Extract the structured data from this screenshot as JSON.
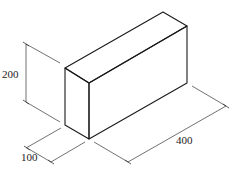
{
  "diagram": {
    "type": "isometric-dimensioned-drawing",
    "colors": {
      "line": "#1a1a1a",
      "dimension_line": "#333333",
      "background": "#ffffff"
    },
    "dimensions": {
      "height": {
        "label": "200"
      },
      "width": {
        "label": "100"
      },
      "length": {
        "label": "400"
      }
    }
  }
}
